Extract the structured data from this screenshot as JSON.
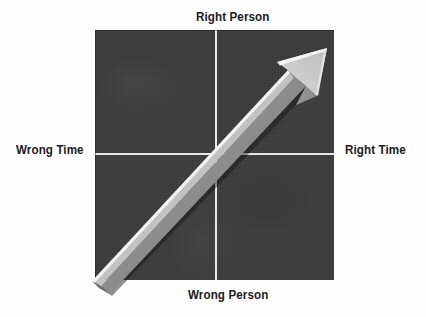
{
  "diagram": {
    "type": "quadrant-matrix",
    "panel_color": "#3b3b3b",
    "axis_color": "#e8e8e8",
    "arrow_face_color": "#c9c9c9",
    "arrow_side_color": "#8d8d8d",
    "arrow_highlight_color": "#f2f2f2",
    "labels": {
      "top": "Right Person",
      "bottom": "Wrong Person",
      "left": "Wrong Time",
      "right": "Right Time"
    },
    "arrow": {
      "name": "diagonal-growth-arrow",
      "direction": "bottom-left-to-top-right",
      "from_quadrant": "Wrong Person / Wrong Time",
      "to_quadrant": "Right Person / Right Time"
    }
  }
}
